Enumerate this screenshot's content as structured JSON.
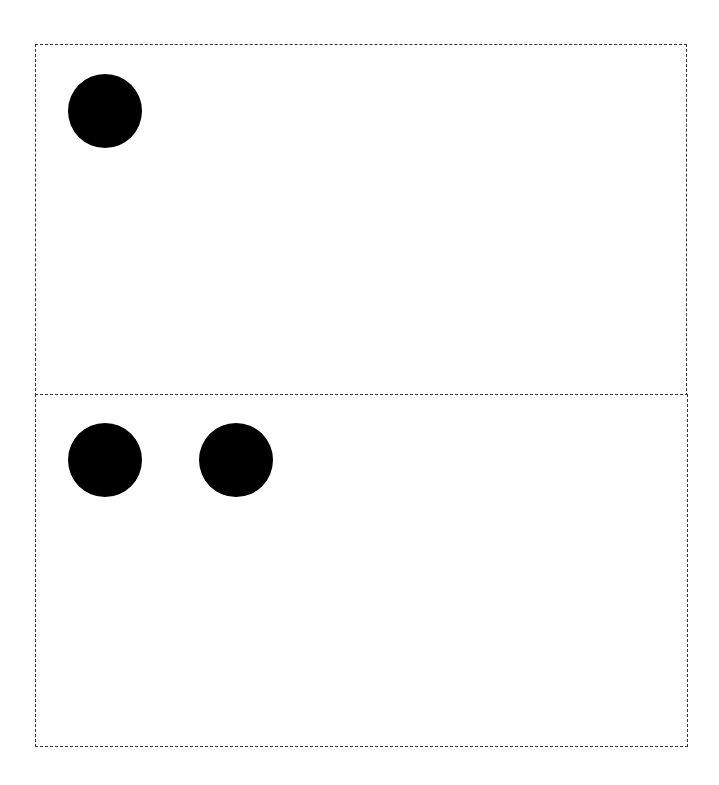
{
  "diagram": {
    "border_color": "#333333",
    "dot_color": "#000000",
    "panels": [
      {
        "name": "top-panel",
        "box": {
          "x": 35,
          "y": 44,
          "w": 652,
          "h": 351
        },
        "dots": [
          {
            "cx": 105,
            "cy": 111,
            "r": 37
          }
        ],
        "dot_count": 1
      },
      {
        "name": "bottom-panel",
        "box": {
          "x": 35,
          "y": 394,
          "w": 653,
          "h": 352
        },
        "dots": [
          {
            "cx": 105,
            "cy": 460,
            "r": 37
          },
          {
            "cx": 236,
            "cy": 460,
            "r": 37
          }
        ],
        "dot_count": 2
      }
    ]
  }
}
